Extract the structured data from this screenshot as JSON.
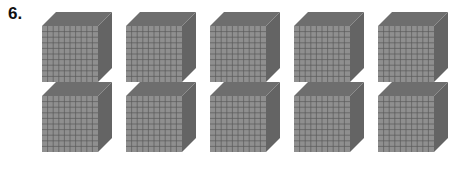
{
  "problem": {
    "number_label": "6.",
    "description": "Base-ten thousand cubes",
    "rows": 2,
    "cubes_per_row": 5,
    "cube_count": 10,
    "grid_divisions": 10
  },
  "colors": {
    "front_face": "#8f8f8f",
    "top_face": "#6e6e6e",
    "side_face": "#646464",
    "grid_line": "#5a5a5a"
  },
  "cubes": [
    {
      "row": 0,
      "col": 0
    },
    {
      "row": 0,
      "col": 1
    },
    {
      "row": 0,
      "col": 2
    },
    {
      "row": 0,
      "col": 3
    },
    {
      "row": 0,
      "col": 4
    },
    {
      "row": 1,
      "col": 0
    },
    {
      "row": 1,
      "col": 1
    },
    {
      "row": 1,
      "col": 2
    },
    {
      "row": 1,
      "col": 3
    },
    {
      "row": 1,
      "col": 4
    }
  ]
}
